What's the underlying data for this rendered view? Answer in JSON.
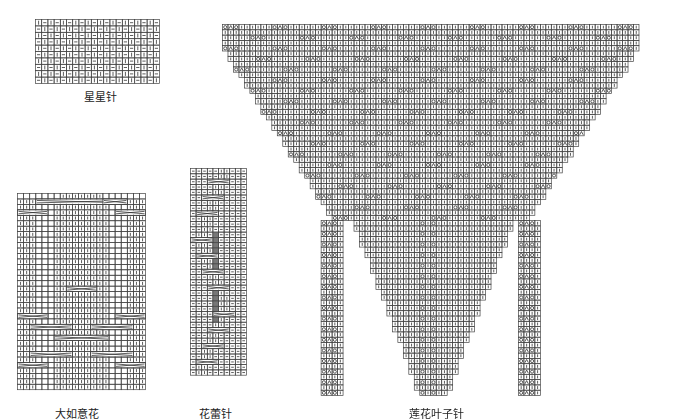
{
  "charts": [
    {
      "id": "xingxing",
      "title": "星星针",
      "x": 35,
      "y": 19,
      "cell_w": 6.2,
      "cell_h": 6.4,
      "cols": 20,
      "rows": 10,
      "pattern": "star",
      "label_x": 100,
      "label_y": 88
    },
    {
      "id": "daruyi",
      "title": "大如意花",
      "x": 17,
      "y": 193,
      "cell_w": 6.1,
      "cell_h": 5.45,
      "cols": 21,
      "rows": 36,
      "pattern": "ruyi",
      "label_x": 77,
      "label_y": 405
    },
    {
      "id": "hualei",
      "title": "花蕾针",
      "x": 190,
      "y": 168,
      "cell_w": 5.6,
      "cell_h": 5.3,
      "cols": 10,
      "rows": 39,
      "pattern": "bud",
      "label_x": 215,
      "label_y": 405
    },
    {
      "id": "lianhua",
      "title": "莲花叶子针",
      "x": 222,
      "y": 24,
      "cell_w": 5.48,
      "cell_h": 5.3,
      "cols": 76,
      "rows": 70,
      "pattern": "lotus",
      "label_x": 436,
      "label_y": 405
    }
  ],
  "symbols": {
    "knit": "|",
    "purl": "–",
    "yarn_over": "O",
    "double_decrease": "▲",
    "left_decrease": "╲",
    "right_decrease": "╱",
    "bobble": "shaded"
  },
  "colors": {
    "grid": "#444444",
    "stroke": "#333333",
    "shade": "#777777",
    "background": "#ffffff"
  }
}
